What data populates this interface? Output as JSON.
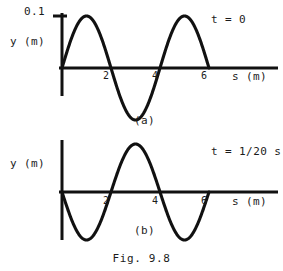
{
  "figure": {
    "caption": "Fig. 9.8"
  },
  "panel_a": {
    "condition_label": "t = 0",
    "sub_caption": "(a)",
    "y_axis_label": "y (m)",
    "x_axis_label": "s (m)",
    "y_max_label": "0.1",
    "x_ticks": [
      "2",
      "4",
      "6"
    ]
  },
  "panel_b": {
    "condition_label": "t = 1/20 s",
    "sub_caption": "(b)",
    "y_axis_label": "y (m)",
    "x_axis_label": "s (m)",
    "x_ticks": [
      "2",
      "4",
      "6"
    ]
  },
  "chart_data": [
    {
      "type": "line",
      "title": "(a)",
      "annotation": "t = 0",
      "xlabel": "s (m)",
      "ylabel": "y (m)",
      "xlim": [
        0,
        7.2
      ],
      "ylim": [
        -0.1,
        0.1
      ],
      "xticks": [
        2,
        4,
        6
      ],
      "yticks": [
        0.1
      ],
      "ytick_labels": [
        "0.1"
      ],
      "grid": false,
      "legend": null,
      "wave": {
        "amplitude": 0.1,
        "wavelength": 4,
        "phase_deg": 0,
        "form": "y = 0.1 sin(2*pi*x/4)",
        "x_range": [
          0,
          6
        ]
      },
      "x": [
        0,
        0.25,
        0.5,
        0.75,
        1,
        1.25,
        1.5,
        1.75,
        2,
        2.25,
        2.5,
        2.75,
        3,
        3.25,
        3.5,
        3.75,
        4,
        4.25,
        4.5,
        4.75,
        5,
        5.25,
        5.5,
        5.75,
        6
      ],
      "y": [
        0,
        0.0383,
        0.0707,
        0.0924,
        0.1,
        0.0924,
        0.0707,
        0.0383,
        0,
        -0.0383,
        -0.0707,
        -0.0924,
        -0.1,
        -0.0924,
        -0.0707,
        -0.0383,
        0,
        0.0383,
        0.0707,
        0.0924,
        0.1,
        0.0924,
        0.0707,
        0.0383,
        0
      ]
    },
    {
      "type": "line",
      "title": "(b)",
      "annotation": "t = 1/20 s",
      "xlabel": "s (m)",
      "ylabel": "y (m)",
      "xlim": [
        0,
        7.2
      ],
      "ylim": [
        -0.1,
        0.1
      ],
      "xticks": [
        2,
        4,
        6
      ],
      "yticks": [],
      "ytick_labels": [],
      "grid": false,
      "legend": null,
      "wave": {
        "amplitude": 0.1,
        "wavelength": 4,
        "phase_deg": 180,
        "form": "y = -0.1 sin(2*pi*x/4)",
        "x_range": [
          0,
          6
        ]
      },
      "x": [
        0,
        0.25,
        0.5,
        0.75,
        1,
        1.25,
        1.5,
        1.75,
        2,
        2.25,
        2.5,
        2.75,
        3,
        3.25,
        3.5,
        3.75,
        4,
        4.25,
        4.5,
        4.75,
        5,
        5.25,
        5.5,
        5.75,
        6
      ],
      "y": [
        0,
        -0.0383,
        -0.0707,
        -0.0924,
        -0.1,
        -0.0924,
        -0.0707,
        -0.0383,
        0,
        0.0383,
        0.0707,
        0.0924,
        0.1,
        0.0924,
        0.0707,
        0.0383,
        0,
        -0.0383,
        -0.0707,
        -0.0924,
        -0.1,
        -0.0924,
        -0.0707,
        -0.0383,
        0
      ]
    }
  ]
}
